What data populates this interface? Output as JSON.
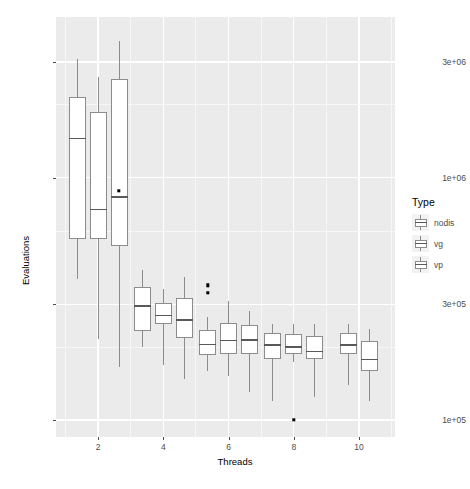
{
  "chart_data": {
    "type": "box",
    "title": "",
    "xlabel": "Threads",
    "ylabel": "Evaluations",
    "yscale": "log",
    "ylim": [
      88000,
      3900000
    ],
    "grid": true,
    "y_ticks": [
      {
        "label": "3e+06",
        "value": 3000000
      },
      {
        "label": "1e+06",
        "value": 1000000
      },
      {
        "label": "3e+05",
        "value": 300000
      },
      {
        "label": "1e+05",
        "value": 100000
      }
    ],
    "x_ticks": [
      {
        "label": "2",
        "value": 2
      },
      {
        "label": "4",
        "value": 4
      },
      {
        "label": "6",
        "value": 6
      },
      {
        "label": "8",
        "value": 8
      },
      {
        "label": "10",
        "value": 10
      }
    ],
    "legend": {
      "title": "Type",
      "position": "right",
      "entries": [
        {
          "label": "nodis"
        },
        {
          "label": "vg"
        },
        {
          "label": "vp"
        }
      ]
    },
    "groups": [
      {
        "x": 2,
        "boxes": [
          {
            "type": "nodis",
            "lower_whisker": 380000,
            "q1": 560000,
            "median": 1450000,
            "q3": 2150000,
            "upper_whisker": 3080000,
            "outliers": []
          },
          {
            "type": "vg",
            "lower_whisker": 215000,
            "q1": 560000,
            "median": 740000,
            "q3": 1860000,
            "upper_whisker": 2600000,
            "outliers": []
          },
          {
            "type": "vp",
            "lower_whisker": 165000,
            "q1": 520000,
            "median": 830000,
            "q3": 2550000,
            "upper_whisker": 3650000,
            "outliers": [
              880000
            ]
          }
        ]
      },
      {
        "x": 4,
        "boxes": [
          {
            "type": "nodis",
            "lower_whisker": 200000,
            "q1": 232000,
            "median": 296000,
            "q3": 355000,
            "upper_whisker": 415000,
            "outliers": []
          },
          {
            "type": "vg",
            "lower_whisker": 168000,
            "q1": 250000,
            "median": 270000,
            "q3": 305000,
            "upper_whisker": 348000,
            "outliers": []
          },
          {
            "type": "vp",
            "lower_whisker": 148000,
            "q1": 218000,
            "median": 258000,
            "q3": 320000,
            "upper_whisker": 390000,
            "outliers": []
          }
        ]
      },
      {
        "x": 6,
        "boxes": [
          {
            "type": "nodis",
            "lower_whisker": 160000,
            "q1": 185000,
            "median": 205000,
            "q3": 235000,
            "upper_whisker": 265000,
            "outliers": [
              360000,
              335000
            ]
          },
          {
            "type": "vg",
            "lower_whisker": 152000,
            "q1": 188000,
            "median": 213000,
            "q3": 252000,
            "upper_whisker": 310000,
            "outliers": []
          },
          {
            "type": "vp",
            "lower_whisker": 130000,
            "q1": 188000,
            "median": 214000,
            "q3": 246000,
            "upper_whisker": 282000,
            "outliers": []
          }
        ]
      },
      {
        "x": 8,
        "boxes": [
          {
            "type": "nodis",
            "lower_whisker": 120000,
            "q1": 178000,
            "median": 204000,
            "q3": 228000,
            "upper_whisker": 250000,
            "outliers": []
          },
          {
            "type": "vg",
            "lower_whisker": 173000,
            "q1": 188000,
            "median": 200000,
            "q3": 226000,
            "upper_whisker": 250000,
            "outliers": [
              100000
            ]
          },
          {
            "type": "vp",
            "lower_whisker": 124000,
            "q1": 178000,
            "median": 192000,
            "q3": 222000,
            "upper_whisker": 248000,
            "outliers": []
          }
        ]
      },
      {
        "x": 10,
        "boxes": [
          {
            "type": "vg",
            "lower_whisker": 140000,
            "q1": 188000,
            "median": 204000,
            "q3": 228000,
            "upper_whisker": 248000,
            "outliers": []
          },
          {
            "type": "vp",
            "lower_whisker": 120000,
            "q1": 160000,
            "median": 178000,
            "q3": 212000,
            "upper_whisker": 238000,
            "outliers": []
          }
        ]
      }
    ],
    "colors": {
      "panel_background": "#ebebeb",
      "grid_major": "#ffffff",
      "grid_minor": "#f7f7f7",
      "box_fill": "#ffffff",
      "box_stroke": "#8c8c8c",
      "median_stroke": "#595959",
      "outlier": "#000000",
      "text": "#4d4d4d"
    }
  }
}
